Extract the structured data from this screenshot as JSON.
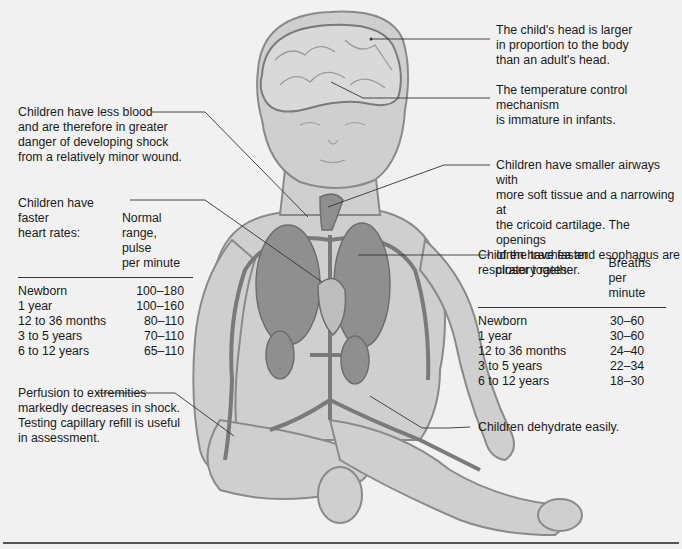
{
  "figure": {
    "colors": {
      "skin": "#cfcfcf",
      "outline": "#8a8a8a",
      "organ": "#8f8f8f",
      "vessel": "#7a7a7a",
      "leader": "#333333",
      "background": "#f1f1f1"
    }
  },
  "callouts": {
    "head": "The child's head is larger\nin proportion to the body\nthan an adult's head.",
    "temperature": "The temperature control mechanism\nis immature in infants.",
    "blood": "Children have less blood\nand are therefore in greater\ndanger of developing shock\nfrom a relatively minor wound.",
    "airways": "Children have smaller airways with\nmore soft tissue and a narrowing at\nthe cricoid cartilage. The openings\nof the trachea and esophagus are\ncloser together.",
    "perfusion": "Perfusion to extremities\nmarkedly decreases in shock.\nTesting capillary refill is useful\nin assessment.",
    "dehydrate": "Children dehydrate easily."
  },
  "heart_table": {
    "title": "Children have faster\nheart rates:",
    "header": "Normal range,\npulse\nper minute",
    "rows": [
      {
        "age": "Newborn",
        "value": "100–180"
      },
      {
        "age": "1 year",
        "value": "100–160"
      },
      {
        "age": "12 to 36 months",
        "value": "80–110"
      },
      {
        "age": "3 to 5 years",
        "value": "70–110"
      },
      {
        "age": "6 to 12 years",
        "value": "65–110"
      }
    ]
  },
  "resp_table": {
    "title": "Children have faster\nrespiratory rates:",
    "header": "Breaths\nper minute",
    "rows": [
      {
        "age": "Newborn",
        "value": "30–60"
      },
      {
        "age": "1 year",
        "value": "30–60"
      },
      {
        "age": "12 to 36 months",
        "value": "24–40"
      },
      {
        "age": "3 to 5 years",
        "value": "22–34"
      },
      {
        "age": "6 to 12 years",
        "value": "18–30"
      }
    ]
  }
}
